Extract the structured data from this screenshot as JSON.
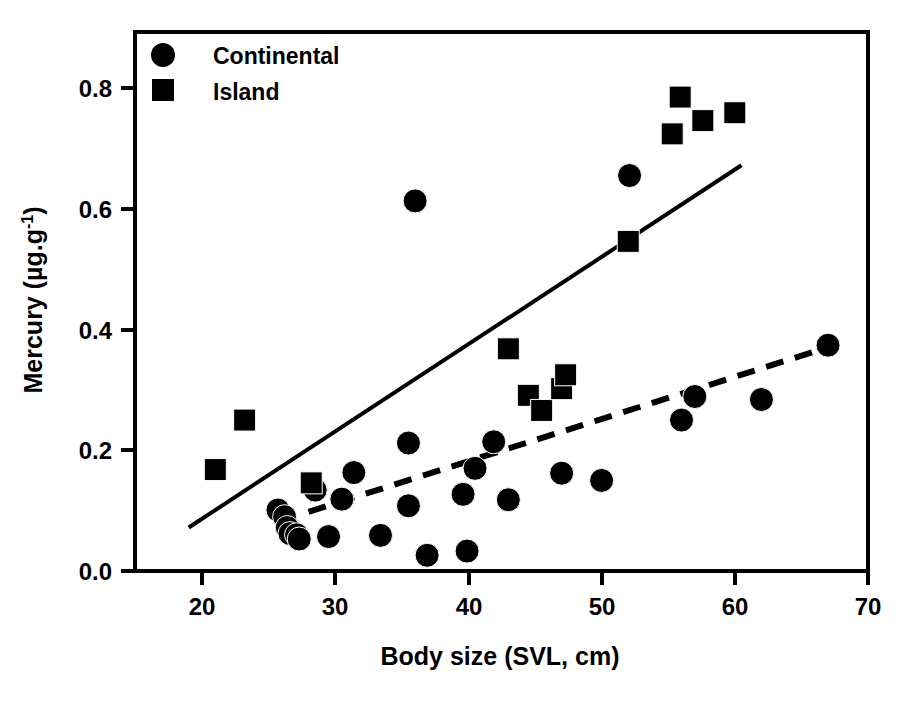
{
  "chart_data": {
    "type": "scatter",
    "title": "",
    "xlabel": "Body size (SVL, cm)",
    "ylabel": "Mercury (µg.g⁻¹)",
    "ylabel_parts": {
      "prefix": "Mercury (µg.g",
      "exponent": "-1",
      "suffix": ")"
    },
    "xlim": [
      15,
      70
    ],
    "ylim": [
      0.0,
      0.88
    ],
    "xticks": [
      20,
      30,
      40,
      50,
      60,
      70
    ],
    "xtick_labels": [
      "20",
      "30",
      "40",
      "50",
      "60",
      "70"
    ],
    "yticks": [
      0.0,
      0.2,
      0.4,
      0.6,
      0.8
    ],
    "ytick_labels": [
      "0.0",
      "0.2",
      "0.4",
      "0.6",
      "0.8"
    ],
    "grid": false,
    "legend_position": "top-left",
    "frame": true,
    "colors": {
      "marker": "#000000",
      "axis": "#000000",
      "background": "#ffffff"
    },
    "series": [
      {
        "name": "Continental",
        "marker": "circle",
        "legend_label": "Continental",
        "points": [
          [
            25.7,
            0.101
          ],
          [
            26.2,
            0.09
          ],
          [
            26.4,
            0.072
          ],
          [
            26.6,
            0.062
          ],
          [
            27.1,
            0.06
          ],
          [
            27.3,
            0.053
          ],
          [
            28.5,
            0.134
          ],
          [
            29.5,
            0.057
          ],
          [
            30.5,
            0.119
          ],
          [
            31.4,
            0.163
          ],
          [
            33.4,
            0.059
          ],
          [
            35.5,
            0.212
          ],
          [
            35.5,
            0.108
          ],
          [
            36.0,
            0.613
          ],
          [
            36.9,
            0.026
          ],
          [
            39.6,
            0.127
          ],
          [
            39.9,
            0.033
          ],
          [
            40.5,
            0.17
          ],
          [
            41.9,
            0.214
          ],
          [
            43.0,
            0.118
          ],
          [
            47.0,
            0.162
          ],
          [
            50.0,
            0.15
          ],
          [
            52.1,
            0.655
          ],
          [
            56.0,
            0.25
          ],
          [
            57.0,
            0.289
          ],
          [
            62.0,
            0.284
          ],
          [
            67.0,
            0.374
          ]
        ]
      },
      {
        "name": "Island",
        "marker": "square",
        "legend_label": "Island",
        "points": [
          [
            21.0,
            0.168
          ],
          [
            23.2,
            0.25
          ],
          [
            28.2,
            0.146
          ],
          [
            43.0,
            0.368
          ],
          [
            44.5,
            0.291
          ],
          [
            45.5,
            0.266
          ],
          [
            47.0,
            0.302
          ],
          [
            47.3,
            0.325
          ],
          [
            52.0,
            0.546
          ],
          [
            55.3,
            0.724
          ],
          [
            55.9,
            0.785
          ],
          [
            57.6,
            0.746
          ],
          [
            60.0,
            0.759
          ]
        ]
      }
    ],
    "trendlines": [
      {
        "name": "Island regression",
        "style": "solid",
        "x_start": 19.0,
        "y_start": 0.072,
        "x_end": 60.5,
        "y_end": 0.672
      },
      {
        "name": "Continental regression",
        "style": "dashed",
        "x_start": 28.0,
        "y_start": 0.098,
        "x_end": 67.5,
        "y_end": 0.374
      }
    ]
  },
  "legend": {
    "entries": [
      {
        "label": "Continental",
        "marker": "circle"
      },
      {
        "label": "Island",
        "marker": "square"
      }
    ]
  },
  "axes": {
    "x_title": "Body size (SVL, cm)",
    "y_title_prefix": "Mercury (µg.g",
    "y_title_exponent": "-1",
    "y_title_suffix": ")",
    "x_tick_0": "20",
    "x_tick_1": "30",
    "x_tick_2": "40",
    "x_tick_3": "50",
    "x_tick_4": "60",
    "x_tick_5": "70",
    "y_tick_0": "0.0",
    "y_tick_1": "0.2",
    "y_tick_2": "0.4",
    "y_tick_3": "0.6",
    "y_tick_4": "0.8"
  },
  "caption": {
    "text": ""
  }
}
